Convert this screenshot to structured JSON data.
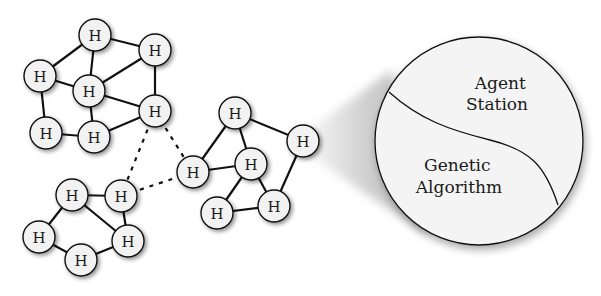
{
  "diagram": {
    "node_label": "H",
    "clusters": [
      {
        "id": "cluster-top-left",
        "nodes": [
          [
            95,
            35
          ],
          [
            155,
            50
          ],
          [
            40,
            76
          ],
          [
            89,
            91
          ],
          [
            155,
            111
          ],
          [
            46,
            133
          ],
          [
            94,
            137
          ]
        ],
        "edges": [
          [
            0,
            1
          ],
          [
            0,
            2
          ],
          [
            0,
            3
          ],
          [
            1,
            3
          ],
          [
            1,
            4
          ],
          [
            2,
            3
          ],
          [
            2,
            5
          ],
          [
            3,
            4
          ],
          [
            3,
            6
          ],
          [
            4,
            6
          ],
          [
            5,
            6
          ]
        ]
      },
      {
        "id": "cluster-bottom-left",
        "nodes": [
          [
            72,
            195
          ],
          [
            121,
            196
          ],
          [
            39,
            237
          ],
          [
            128,
            241
          ],
          [
            81,
            260
          ]
        ],
        "edges": [
          [
            0,
            1
          ],
          [
            0,
            2
          ],
          [
            0,
            3
          ],
          [
            1,
            3
          ],
          [
            2,
            4
          ],
          [
            3,
            4
          ]
        ]
      },
      {
        "id": "cluster-center",
        "nodes": [
          [
            235,
            113
          ],
          [
            303,
            141
          ],
          [
            193,
            172
          ],
          [
            251,
            164
          ],
          [
            217,
            213
          ],
          [
            274,
            206
          ]
        ],
        "edges": [
          [
            0,
            1
          ],
          [
            0,
            2
          ],
          [
            0,
            3
          ],
          [
            1,
            5
          ],
          [
            2,
            3
          ],
          [
            3,
            4
          ],
          [
            3,
            5
          ],
          [
            4,
            5
          ]
        ]
      }
    ],
    "dashed_links": [
      {
        "from": [
          155,
          111
        ],
        "to": [
          121,
          196
        ]
      },
      {
        "from": [
          155,
          111
        ],
        "to": [
          193,
          172
        ]
      },
      {
        "from": [
          121,
          196
        ],
        "to": [
          193,
          172
        ]
      }
    ],
    "zoom_source_node": [
      303,
      141
    ],
    "zoom_circle": {
      "cx": 479,
      "cy": 141,
      "r": 104
    },
    "regions": {
      "upper": {
        "line1": "Agent",
        "line2": "Station"
      },
      "lower": {
        "line1": "Genetic",
        "line2": "Algorithm"
      }
    },
    "colors": {
      "node_fill": "#f2f2f2",
      "node_stroke": "#111111",
      "edge": "#111111",
      "circle_fill": "#f4f4f4",
      "shadow": "#bdbdbd"
    }
  }
}
